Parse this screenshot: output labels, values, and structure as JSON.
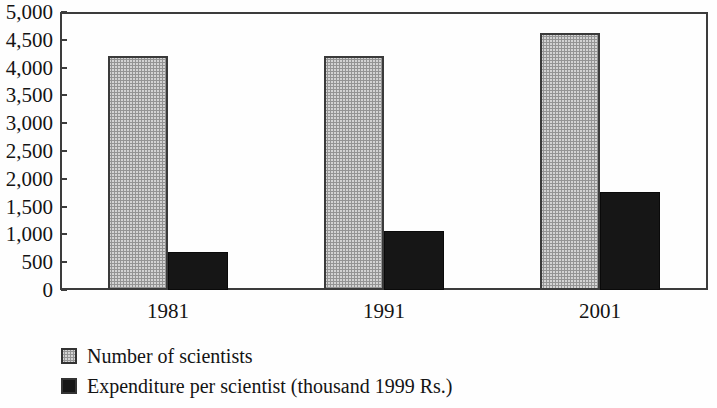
{
  "chart_data": {
    "type": "bar",
    "title": "",
    "xlabel": "",
    "ylabel": "",
    "categories": [
      "1981",
      "1991",
      "2001"
    ],
    "series": [
      {
        "name": "Number of scientists",
        "values": [
          4200,
          4200,
          4620
        ],
        "color": "#d3d3d3",
        "pattern": "halftone-gray"
      },
      {
        "name": "Expenditure per scientist (thousand 1999 Rs.)",
        "values": [
          690,
          1070,
          1770
        ],
        "color": "#161616",
        "pattern": "solid-black"
      }
    ],
    "ylim": [
      0,
      5000
    ],
    "ytick_step": 500,
    "ytick_labels": [
      "0",
      "500",
      "1,000",
      "1,500",
      "2,000",
      "2,500",
      "3,000",
      "3,500",
      "4,000",
      "4,500",
      "5,000"
    ],
    "grid": false,
    "legend_position": "bottom-left",
    "axis_color": "#3c3c3c",
    "text_color": "#141414"
  }
}
